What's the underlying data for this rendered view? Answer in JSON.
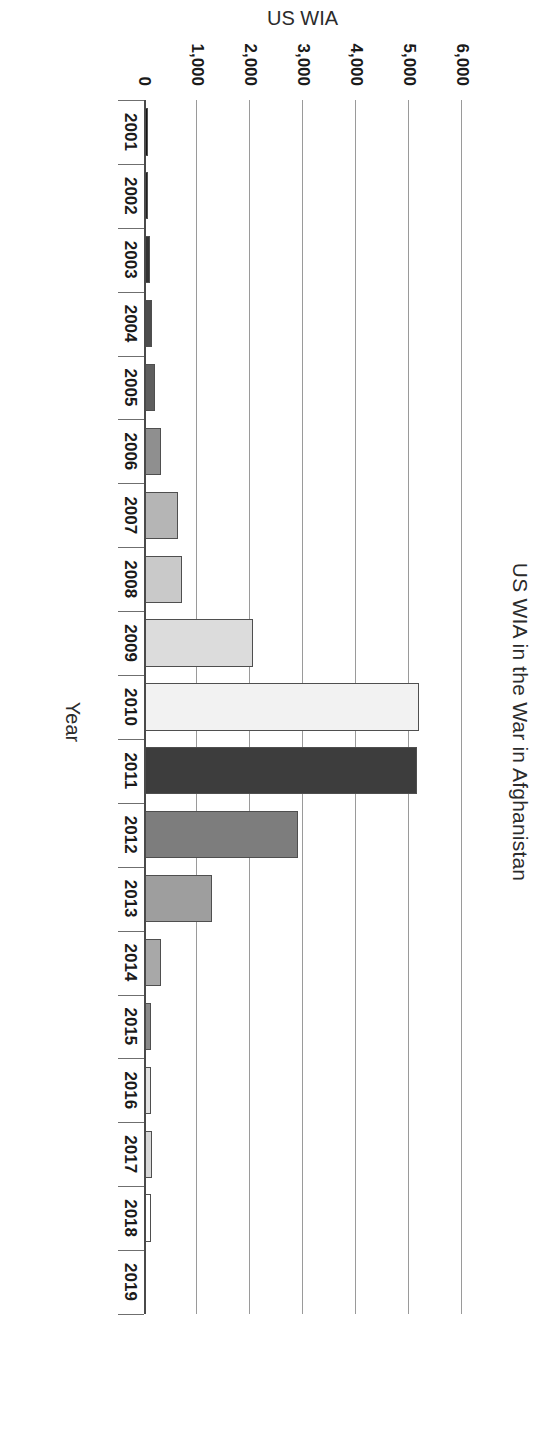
{
  "chart_data": {
    "type": "bar",
    "title": "US WIA in the War in Afghanistan",
    "xlabel": "Year",
    "ylabel": "US WIA",
    "orientation": "vertical",
    "grid": true,
    "legend": "none",
    "ylim": [
      0,
      6000
    ],
    "ytick_labels": [
      "0",
      "1,000",
      "2,000",
      "3,000",
      "4,000",
      "5,000",
      "6,000"
    ],
    "yticks": [
      0,
      1000,
      2000,
      3000,
      4000,
      5000,
      6000
    ],
    "categories": [
      "2001",
      "2002",
      "2003",
      "2004",
      "2005",
      "2006",
      "2007",
      "2008",
      "2009",
      "2010",
      "2011",
      "2012",
      "2013",
      "2014",
      "2015",
      "2016",
      "2017",
      "2018",
      "2019"
    ],
    "values": [
      70,
      85,
      105,
      150,
      210,
      330,
      640,
      710,
      2060,
      5180,
      5150,
      2910,
      1290,
      330,
      140,
      130,
      150,
      135,
      0
    ],
    "bar_colors": [
      "#141414",
      "#202020",
      "#333333",
      "#4d4d4d",
      "#5e5e5e",
      "#8f8f8f",
      "#b5b5b5",
      "#c9c9c9",
      "#dcdcdc",
      "#f2f2f2",
      "#3d3d3d",
      "#7d7d7d",
      "#9e9e9e",
      "#a8a8a8",
      "#8a8a8a",
      "#e2e2e2",
      "#d8d8d8",
      "#ffffff",
      "#ffffff"
    ],
    "bar_border_color": "#4f4f4f",
    "gridline_color": "#9a9a9a",
    "axis_color": "#4a4a4a",
    "background": "#ffffff"
  }
}
